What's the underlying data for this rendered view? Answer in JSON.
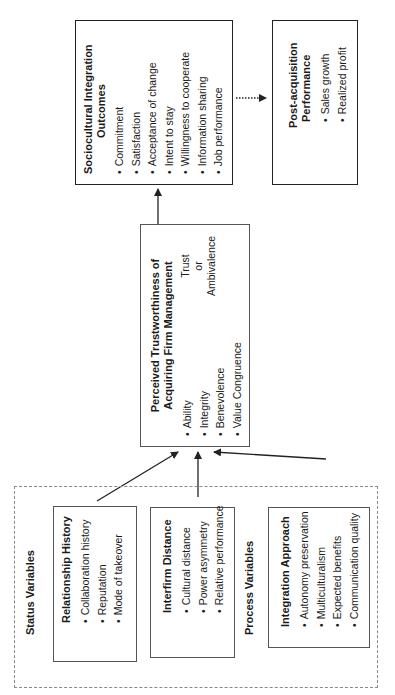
{
  "status_group": {
    "label": "Status Variables",
    "relationship_history": {
      "title": "Relationship History",
      "items": [
        "Collaboration history",
        "Reputation",
        "Mode of takeover"
      ]
    },
    "interfirm_distance": {
      "title": "Interfirm Distance",
      "items": [
        "Cultural distance",
        "Power asymmetry",
        "Relative performance"
      ]
    }
  },
  "process_group": {
    "label": "Process Variables",
    "integration_approach": {
      "title": "Integration Approach",
      "items": [
        "Autonomy preservation",
        "Multiculturalism",
        "Expected benefits",
        "Communication quality"
      ]
    }
  },
  "trustworthiness": {
    "title_line1": "Perceived Trustworthiness of",
    "title_line2": "Acquiring Firm Management",
    "items": [
      "Ability",
      "Integrity",
      "Benevolence",
      "Value Congruence"
    ],
    "outcome_line1": "Trust",
    "outcome_line2": "or",
    "outcome_line3": "Ambivalence"
  },
  "sociocultural": {
    "title_line1": "Sociocultural Integration",
    "title_line2": "Outcomes",
    "items": [
      "Commitment",
      "Satisfaction",
      "Acceptance of change",
      "Intent to stay",
      "Willingness to cooperate",
      "Information sharing",
      "Job performance"
    ]
  },
  "post_acquisition": {
    "title_line1": "Post-acquisition",
    "title_line2": "Performance",
    "items": [
      "Sales growth",
      "Realized profit"
    ]
  }
}
